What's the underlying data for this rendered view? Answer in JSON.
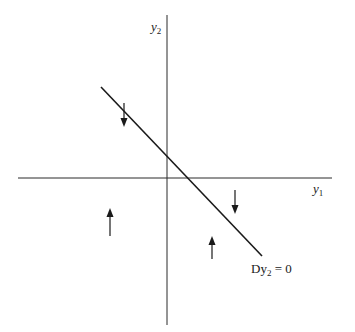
{
  "diagram": {
    "type": "phase-diagram",
    "axes": {
      "x_label": "y",
      "x_label_sub": "1",
      "y_label": "y",
      "y_label_sub": "2",
      "origin_px": [
        167,
        178
      ]
    },
    "isocline": {
      "label_main": "Dy",
      "label_sub": "2",
      "label_rest": " = 0",
      "slope": "negative",
      "from_px": [
        101,
        87
      ],
      "to_px": [
        262,
        256
      ]
    },
    "arrows": [
      {
        "name": "arrow-down-upper-left",
        "direction": "down",
        "x": 124,
        "y1": 103,
        "y2": 125
      },
      {
        "name": "arrow-up-lower-left",
        "direction": "up",
        "x": 110,
        "y1": 234,
        "y2": 209
      },
      {
        "name": "arrow-down-right",
        "direction": "down",
        "x": 235,
        "y1": 191,
        "y2": 213
      },
      {
        "name": "arrow-up-lower-right",
        "direction": "up",
        "x": 212,
        "y1": 258,
        "y2": 238
      }
    ],
    "colors": {
      "line": "#1a1a1a",
      "axis": "#2a2a2a",
      "background": "#ffffff"
    }
  }
}
